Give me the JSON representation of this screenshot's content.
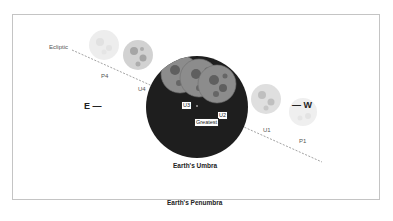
{
  "diagram": {
    "type": "lunar-eclipse-contact-diagram",
    "ecliptic_label": "Ecliptic",
    "direction_east": "E —",
    "direction_west": "— W",
    "umbra_label": "Earth's Umbra",
    "penumbra_label": "Earth's Penumbra",
    "contacts": {
      "p4": "P4",
      "u4": "U4",
      "u3": "U3",
      "u2": "U2",
      "greatest": "Greatest",
      "u1": "U1",
      "p1": "P1"
    },
    "colors": {
      "umbra": "#1e1e1e",
      "frame": "#c4c4c4",
      "ecliptic": "#8a8a8a",
      "moon_eclipsed": "#8c8c8c",
      "moon_partial": "#9a9a9a",
      "moon_penumbral": "#d4d4d4"
    }
  }
}
